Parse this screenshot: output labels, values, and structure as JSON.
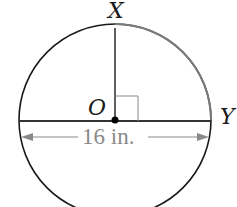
{
  "diagram": {
    "type": "circle-geometry",
    "labels": {
      "top_point": "X",
      "center_point": "O",
      "right_point": "Y"
    },
    "dimension": {
      "text": "16 in.",
      "refers_to": "diameter"
    },
    "annotations": {
      "right_angle_at": "O",
      "highlighted_arc": "XY"
    },
    "colors": {
      "stroke": "#1a1a1a",
      "arc_highlight": "#7a7a7a",
      "dimension": "#8a8a8a"
    }
  }
}
